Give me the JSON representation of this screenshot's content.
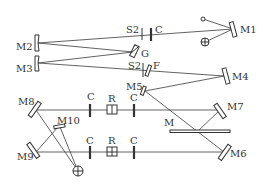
{
  "diagram": {
    "type": "optical-layout",
    "labels": {
      "M1": "M1",
      "M2": "M2",
      "M3": "M3",
      "M4": "M4",
      "M5": "M5",
      "M6": "M6",
      "M7": "M7",
      "M8": "M8",
      "M9": "M9",
      "M10": "M10",
      "M": "M",
      "G": "G",
      "F": "F",
      "S2_upper": "S2",
      "S2_lower": "S2",
      "C_top": "C",
      "C1_upper": "C",
      "R_upper": "R",
      "C2_upper": "C",
      "C1_lower": "C",
      "R_lower": "R",
      "C2_lower": "C"
    },
    "colors": {
      "line": "#3a3a3a",
      "background": "#ffffff"
    }
  }
}
